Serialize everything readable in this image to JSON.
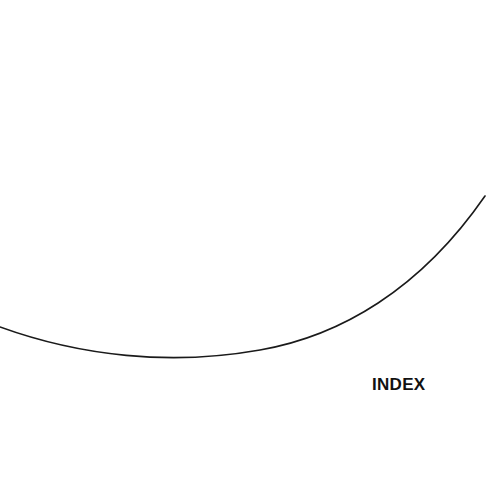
{
  "diagram": {
    "curve": {
      "stroke_color": "#1a1a1a",
      "description": "arc-curve",
      "start": [
        0,
        327
      ],
      "lowest_point": [
        175,
        361
      ],
      "end": [
        485,
        196
      ]
    },
    "label": {
      "text": "INDEX",
      "color": "#111111"
    }
  }
}
